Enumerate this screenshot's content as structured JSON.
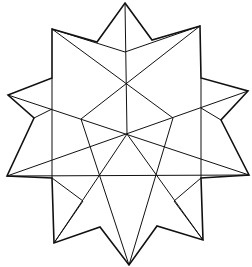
{
  "figure": {
    "stroke_color": "#111111",
    "background": "#ffffff",
    "outline_polygon": [
      [
        125,
        3
      ],
      [
        152,
        40
      ],
      [
        200,
        26
      ],
      [
        201,
        78
      ],
      [
        248,
        91
      ],
      [
        221,
        120
      ],
      [
        249,
        175
      ],
      [
        201,
        178
      ],
      [
        203,
        240
      ],
      [
        157,
        226
      ],
      [
        129,
        265
      ],
      [
        100,
        227
      ],
      [
        54,
        243
      ],
      [
        52,
        178
      ],
      [
        7,
        176
      ],
      [
        34,
        118
      ],
      [
        8,
        95
      ],
      [
        52,
        78
      ],
      [
        52,
        29
      ],
      [
        97,
        42
      ]
    ],
    "inner_lines": [
      [
        [
          125,
          3
        ],
        [
          127,
          134
        ]
      ],
      [
        [
          52,
          29
        ],
        [
          173,
          118
        ]
      ],
      [
        [
          200,
          26
        ],
        [
          81,
          119
        ]
      ],
      [
        [
          52,
          29
        ],
        [
          125,
          52
        ]
      ],
      [
        [
          125,
          52
        ],
        [
          200,
          26
        ]
      ],
      [
        [
          8,
          95
        ],
        [
          249,
          175
        ]
      ],
      [
        [
          248,
          91
        ],
        [
          7,
          176
        ]
      ],
      [
        [
          52,
          78
        ],
        [
          52,
          178
        ]
      ],
      [
        [
          201,
          78
        ],
        [
          201,
          178
        ]
      ],
      [
        [
          7,
          176
        ],
        [
          249,
          175
        ]
      ],
      [
        [
          81,
          119
        ],
        [
          129,
          265
        ]
      ],
      [
        [
          173,
          118
        ],
        [
          129,
          265
        ]
      ],
      [
        [
          127,
          134
        ],
        [
          54,
          243
        ]
      ],
      [
        [
          127,
          134
        ],
        [
          203,
          240
        ]
      ],
      [
        [
          52,
          178
        ],
        [
          83,
          201
        ]
      ],
      [
        [
          83,
          201
        ],
        [
          54,
          243
        ]
      ],
      [
        [
          201,
          178
        ],
        [
          174,
          201
        ]
      ],
      [
        [
          174,
          201
        ],
        [
          203,
          240
        ]
      ],
      [
        [
          34,
          118
        ],
        [
          52,
          109
        ]
      ],
      [
        [
          221,
          120
        ],
        [
          201,
          108
        ]
      ]
    ]
  }
}
